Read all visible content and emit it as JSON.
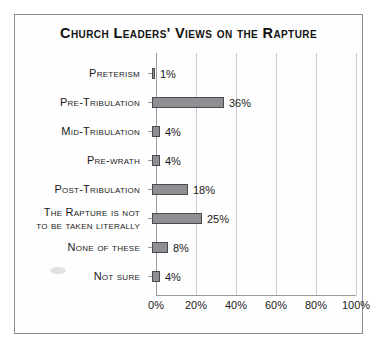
{
  "chart_data": {
    "type": "bar",
    "orientation": "horizontal",
    "title": "Church Leaders' Views on the Rapture",
    "xlabel": "",
    "ylabel": "",
    "xlim": [
      0,
      100
    ],
    "xticks": [
      0,
      20,
      40,
      60,
      80,
      100
    ],
    "xtick_labels": [
      "0%",
      "20%",
      "40%",
      "60%",
      "80%",
      "100%"
    ],
    "grid": true,
    "legend": false,
    "categories": [
      "Preterism",
      "Pre-Tribulation",
      "Mid-Tribulation",
      "Pre-wrath",
      "Post-Tribulation",
      "The Rapture is not to be taken literally",
      "None of these",
      "Not sure"
    ],
    "values": [
      1,
      36,
      4,
      4,
      18,
      25,
      8,
      4
    ],
    "value_labels": [
      "1%",
      "36%",
      "4%",
      "4%",
      "18%",
      "25%",
      "8%",
      "4%"
    ],
    "bars": [
      {
        "label_line1": "Preterism",
        "label_line2": "",
        "value": 1,
        "value_label": "1%"
      },
      {
        "label_line1": "Pre-Tribulation",
        "label_line2": "",
        "value": 36,
        "value_label": "36%"
      },
      {
        "label_line1": "Mid-Tribulation",
        "label_line2": "",
        "value": 4,
        "value_label": "4%"
      },
      {
        "label_line1": "Pre-wrath",
        "label_line2": "",
        "value": 4,
        "value_label": "4%"
      },
      {
        "label_line1": "Post-Tribulation",
        "label_line2": "",
        "value": 18,
        "value_label": "18%"
      },
      {
        "label_line1": "The Rapture is not",
        "label_line2": "to be taken literally",
        "value": 25,
        "value_label": "25%"
      },
      {
        "label_line1": "None of these",
        "label_line2": "",
        "value": 8,
        "value_label": "8%"
      },
      {
        "label_line1": "Not sure",
        "label_line2": "",
        "value": 4,
        "value_label": "4%"
      }
    ],
    "colors": {
      "bar_fill": "#8e8e93",
      "bar_border": "#4a4a4f",
      "gridline": "#c9c9cf",
      "axis": "#9a9aa0",
      "frame": "#8d8d93",
      "text": "#1a1a1a",
      "background": "#fefefe"
    }
  }
}
